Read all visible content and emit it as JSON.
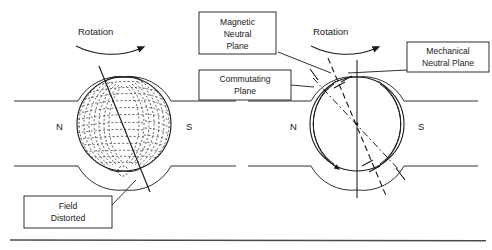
{
  "figure": {
    "type": "diagram",
    "background_color": "#ffffff",
    "line_color": "#1a1a1a",
    "footer_rule": true
  },
  "left_diagram": {
    "name": "distorted-field-view",
    "rotation_label": "Rotation",
    "rotation_direction": "clockwise",
    "pole_labels": {
      "north": "N",
      "south": "S"
    },
    "callouts": [
      {
        "id": "field-distorted",
        "line1": "Field",
        "line2": "Distorted"
      }
    ],
    "armature": {
      "center_x": 124,
      "center_y": 124,
      "radius": 48,
      "field_lines": "dashed-arcs",
      "neutral_axis_tilt_deg": 18
    }
  },
  "right_diagram": {
    "name": "neutral-planes-view",
    "rotation_label": "Rotation",
    "rotation_direction": "clockwise",
    "pole_labels": {
      "north": "N",
      "south": "S"
    },
    "callouts": [
      {
        "id": "magnetic-neutral-plane",
        "line1": "Magnetic",
        "line2": "Neutral",
        "line3": "Plane"
      },
      {
        "id": "commutating-plane",
        "line1": "Commutating",
        "line2": "Plane"
      },
      {
        "id": "mechanical-neutral-plane",
        "line1": "Mechanical",
        "line2": "Neutral Plane"
      }
    ],
    "armature": {
      "center_x": 357,
      "center_y": 124,
      "radius": 48,
      "mechanical_plane_tilt_deg": 0,
      "magnetic_plane_tilt_deg": 20,
      "commutating_plane_tilt_deg": 31
    }
  }
}
